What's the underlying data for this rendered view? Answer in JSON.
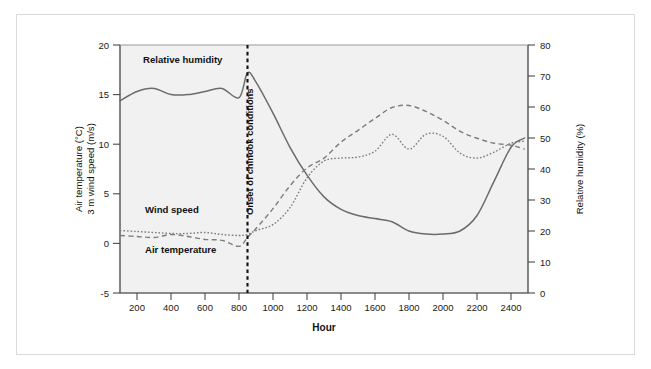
{
  "figure": {
    "background_color": "#ffffff",
    "frame_color": "#d9d9d9",
    "plot_background_color": "#f1f1f1"
  },
  "axes": {
    "x": {
      "label": "Hour",
      "ticks": [
        200,
        400,
        600,
        800,
        1000,
        1200,
        1400,
        1600,
        1800,
        2000,
        2200,
        2400
      ],
      "range": [
        100,
        2500
      ]
    },
    "y_left": {
      "label_line1": "Air temperature (°C)",
      "label_line2": "3 m wind speed (m/s)",
      "ticks": [
        -5,
        0,
        5,
        10,
        15,
        20
      ],
      "range": [
        -5,
        20
      ]
    },
    "y_right": {
      "label": "Relative humidity (%)",
      "ticks": [
        0,
        10,
        20,
        30,
        40,
        50,
        60,
        70,
        80
      ],
      "range": [
        0,
        80
      ]
    }
  },
  "annotations": {
    "onset": {
      "text": "Onset of chinook conditions",
      "hour": 850,
      "style": "vertical-dotted-line"
    },
    "series_labels": {
      "humidity": "Relative humidity",
      "wind": "Wind speed",
      "temperature": "Air temperature"
    }
  },
  "chart_data": {
    "type": "line",
    "title": "",
    "xlabel": "Hour",
    "ylabel": "Air temperature (°C) / 3 m wind speed (m/s)",
    "ylabel_right": "Relative humidity (%)",
    "xlim": [
      100,
      2500
    ],
    "ylim": [
      -5,
      20
    ],
    "ylim_right": [
      0,
      80
    ],
    "grid": false,
    "legend": "inline-labels",
    "x": [
      100,
      200,
      300,
      400,
      500,
      600,
      700,
      800,
      850,
      900,
      1000,
      1100,
      1200,
      1300,
      1400,
      1500,
      1600,
      1700,
      1800,
      1900,
      2000,
      2100,
      2200,
      2300,
      2400,
      2480
    ],
    "series": [
      {
        "name": "Relative humidity",
        "axis": "right",
        "units": "%",
        "linestyle": "solid",
        "color": "#6b6b6b",
        "values": [
          62,
          65,
          66,
          64,
          64,
          65,
          66,
          63,
          71,
          68,
          58,
          47,
          38,
          31,
          27,
          25,
          24,
          23,
          20,
          19,
          19,
          20,
          25,
          36,
          47,
          50
        ]
      },
      {
        "name": "Air temperature",
        "axis": "left",
        "units": "°C",
        "linestyle": "dashed",
        "color": "#7d7d7d",
        "values": [
          0.8,
          0.7,
          0.6,
          0.9,
          0.7,
          0.4,
          0.3,
          -0.3,
          0.6,
          1.5,
          3.5,
          5.8,
          7.6,
          8.6,
          10.2,
          11.4,
          12.6,
          13.7,
          13.9,
          13.3,
          12.4,
          11.3,
          10.6,
          10.1,
          9.9,
          9.5
        ]
      },
      {
        "name": "3 m wind speed",
        "axis": "left",
        "units": "m/s",
        "linestyle": "dotted",
        "color": "#7d7d7d",
        "values": [
          1.3,
          1.2,
          1.1,
          1.0,
          1.0,
          1.1,
          0.9,
          0.8,
          0.9,
          1.3,
          1.9,
          3.6,
          6.6,
          8.3,
          8.6,
          8.7,
          9.3,
          11.0,
          9.5,
          11.0,
          10.8,
          9.1,
          8.6,
          9.2,
          10.1,
          10.3
        ]
      }
    ]
  }
}
